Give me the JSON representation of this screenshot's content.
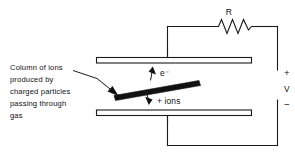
{
  "figure": {
    "caption": {
      "name": "column-of-ions-caption",
      "lines": [
        "Column of ions",
        "produced by",
        "charged particles",
        "passing through",
        "gas"
      ],
      "full_text": "Column of ions produced by charged particles passing through gas"
    },
    "labels": {
      "resistor": "R",
      "voltage": "V",
      "terminal_positive": "+",
      "terminal_negative": "−",
      "electron": "e⁻",
      "positive_ions": "+ ions"
    },
    "components": {
      "top_plate": "top-electrode-plate",
      "bottom_plate": "bottom-electrode-plate",
      "resistor": "resistor-zigzag",
      "ion_column": "ion-column-bar",
      "electron_arrow": "electron-drift-arrow-up",
      "ion_arrow": "positive-ion-drift-arrow-down",
      "caption_pointer": "caption-pointer-arrow"
    },
    "colors": {
      "ink": "#111111",
      "wire": "#1a1a1a",
      "background": "#ffffff",
      "ion_column_fill": "#111111"
    }
  }
}
